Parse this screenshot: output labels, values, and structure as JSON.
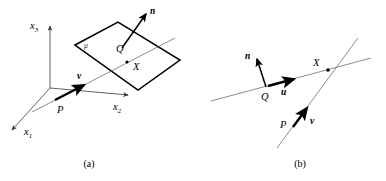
{
  "figure": {
    "panels": [
      {
        "id": "a",
        "caption": "(a)",
        "axes": [
          {
            "name": "x3",
            "label": "x",
            "subscript": "3",
            "direction": "up"
          },
          {
            "name": "x2",
            "label": "x",
            "subscript": "2",
            "direction": "right"
          },
          {
            "name": "x1",
            "label": "x",
            "subscript": "1",
            "direction": "down-left"
          }
        ],
        "plane_label": "μ",
        "points": [
          {
            "name": "P",
            "label": "P"
          },
          {
            "name": "Q",
            "label": "Q"
          },
          {
            "name": "X",
            "label": "X"
          }
        ],
        "vectors": [
          {
            "name": "n",
            "label": "n",
            "role": "plane-normal"
          },
          {
            "name": "v",
            "label": "v",
            "role": "line-direction"
          }
        ]
      },
      {
        "id": "b",
        "caption": "(b)",
        "points": [
          {
            "name": "P",
            "label": "P"
          },
          {
            "name": "Q",
            "label": "Q"
          },
          {
            "name": "X",
            "label": "X"
          }
        ],
        "vectors": [
          {
            "name": "n",
            "label": "n",
            "role": "line-normal"
          },
          {
            "name": "u",
            "label": "u",
            "role": "line-direction"
          },
          {
            "name": "v",
            "label": "v",
            "role": "line-direction"
          }
        ]
      }
    ]
  },
  "colors": {
    "ink": "#000000",
    "thin_line": "#5a5a5a",
    "axis": "#3a3a3a",
    "background": "#ffffff"
  }
}
